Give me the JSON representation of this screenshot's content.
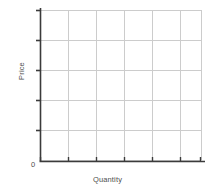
{
  "chart_data": {
    "type": "line",
    "title": "",
    "subtitle": "",
    "xlabel": "Quantity",
    "ylabel": "Price",
    "origin_label": "0",
    "grid": true,
    "legend": null,
    "legend_position": "none",
    "series": [],
    "x": [],
    "values": [],
    "xlim": [
      0,
      7
    ],
    "ylim": [
      0,
      5
    ],
    "x_tick_labels": [],
    "y_tick_labels": [],
    "x_tick_count": 7,
    "y_tick_count": 5,
    "annotations": []
  },
  "geometry": {
    "width": 215,
    "height": 195,
    "plot_left": 40,
    "plot_right": 201,
    "plot_top": 10,
    "plot_bottom": 160,
    "x_axis_end": 205,
    "y_axis_top": 8,
    "x_gridlines": [
      68,
      96,
      124,
      152,
      180,
      201
    ],
    "y_gridlines": [
      10,
      40,
      70,
      100,
      130
    ],
    "x_ticks": [
      40,
      68,
      96,
      124,
      152,
      180,
      200
    ],
    "y_ticks": [
      10,
      40,
      70,
      100,
      130
    ],
    "tick_len": 4
  },
  "colors": {
    "background": "#ffffff",
    "axis": "#3b3b3b",
    "grid": "#cccccc",
    "text": "#4d4d4d"
  }
}
